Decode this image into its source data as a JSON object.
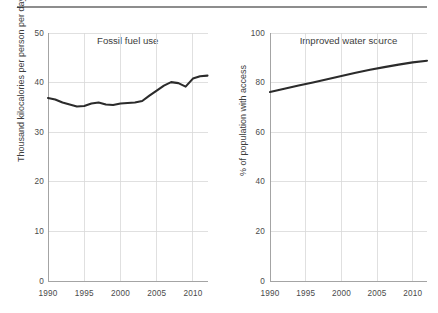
{
  "figure": {
    "top_rule_color": "#8d8d8d",
    "background_color": "#ffffff",
    "line_color": "#2b2b2b",
    "grid_color": "#d8d8d8"
  },
  "panels": {
    "left": {
      "title": "Fossil fuel use",
      "ylabel": "Thousand kilocalories per person per day",
      "ytick_labels": [
        "50",
        "40",
        "30",
        "20",
        "10",
        "0"
      ],
      "xtick_labels": [
        "1990",
        "1995",
        "2000",
        "2005",
        "2010"
      ]
    },
    "right": {
      "title": "Improved water source",
      "ylabel": "% of population with access",
      "ytick_labels": [
        "100",
        "80",
        "60",
        "40",
        "20",
        "0"
      ],
      "xtick_labels": [
        "1990",
        "1995",
        "2000",
        "2005",
        "2010"
      ]
    }
  },
  "chart_data": [
    {
      "type": "line",
      "title": "Fossil fuel use",
      "xlabel": "",
      "ylabel": "Thousand kilocalories per person per day",
      "xlim": [
        1990,
        2012
      ],
      "ylim": [
        0,
        50
      ],
      "yticks": [
        0,
        10,
        20,
        30,
        40,
        50
      ],
      "xticks": [
        1990,
        1995,
        2000,
        2005,
        2010
      ],
      "grid": true,
      "legend": "none",
      "x": [
        1990,
        1991,
        1992,
        1993,
        1994,
        1995,
        1996,
        1997,
        1998,
        1999,
        2000,
        2001,
        2002,
        2003,
        2004,
        2005,
        2006,
        2007,
        2008,
        2009,
        2010,
        2011,
        2012
      ],
      "values": [
        36.1,
        35.8,
        35.2,
        34.8,
        34.4,
        34.5,
        35.0,
        35.2,
        34.8,
        34.7,
        35.0,
        35.1,
        35.2,
        35.5,
        36.6,
        37.6,
        38.6,
        39.3,
        39.1,
        38.4,
        40.0,
        40.5,
        40.6
      ]
    },
    {
      "type": "line",
      "title": "Improved water source",
      "xlabel": "",
      "ylabel": "% of population with access",
      "xlim": [
        1990,
        2012
      ],
      "ylim": [
        0,
        100
      ],
      "yticks": [
        0,
        20,
        40,
        60,
        80,
        100
      ],
      "xticks": [
        1990,
        1995,
        2000,
        2005,
        2010
      ],
      "grid": true,
      "legend": "none",
      "x": [
        1990,
        1992,
        1994,
        1996,
        1998,
        2000,
        2002,
        2004,
        2006,
        2008,
        2010,
        2012
      ],
      "values": [
        76.2,
        77.5,
        78.8,
        80.1,
        81.4,
        82.7,
        84.0,
        85.2,
        86.3,
        87.3,
        88.2,
        88.9
      ]
    }
  ]
}
